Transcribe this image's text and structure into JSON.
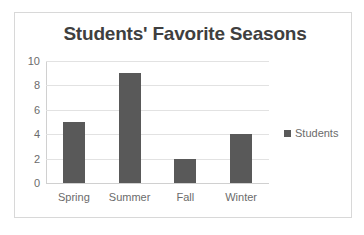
{
  "chart_data": {
    "type": "bar",
    "title": "Students' Favorite Seasons",
    "categories": [
      "Spring",
      "Summer",
      "Fall",
      "Winter"
    ],
    "values": [
      5,
      9,
      2,
      4
    ],
    "series": [
      {
        "name": "Students",
        "values": [
          5,
          9,
          2,
          4
        ]
      }
    ],
    "xlabel": "",
    "ylabel": "",
    "ylim": [
      0,
      10
    ],
    "y_ticks": [
      0,
      2,
      4,
      6,
      8,
      10
    ],
    "grid": true,
    "legend": {
      "position": "right",
      "entries": [
        "Students"
      ]
    },
    "colors": {
      "bar": "#595959",
      "title_text": "#3f3f3f",
      "tick_text": "#6b6b6b",
      "gridline": "#e2e2e2",
      "axis_line": "#d0d0d0",
      "frame_border": "#d8d8d8",
      "background": "#ffffff"
    }
  }
}
